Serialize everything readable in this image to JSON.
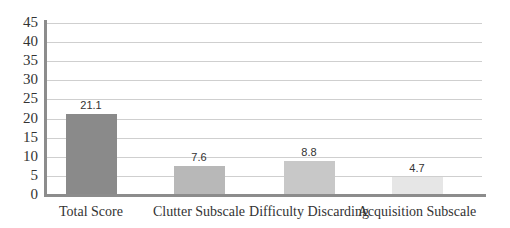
{
  "chart_data": {
    "type": "bar",
    "title": "",
    "xlabel": "",
    "ylabel": "",
    "categories": [
      "Total Score",
      "Clutter Subscale",
      "Difficulty Discarding",
      "Acquisition Subscale"
    ],
    "values": [
      21.1,
      7.6,
      8.8,
      4.7
    ],
    "data_labels": [
      "21.1",
      "7.6",
      "8.8",
      "4.7"
    ],
    "bar_colors": [
      "#8a8a8a",
      "#b8b8b8",
      "#c8c8c8",
      "#e6e6e6"
    ],
    "ylim": [
      0,
      45
    ],
    "yticks": [
      0,
      5,
      10,
      15,
      20,
      25,
      30,
      35,
      40,
      45
    ],
    "grid": true,
    "legend": null
  }
}
